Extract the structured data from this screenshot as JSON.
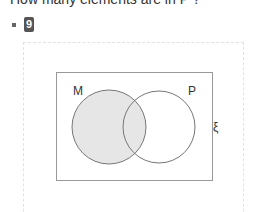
{
  "question": {
    "text": "How many elements are in P ?"
  },
  "answer": {
    "bullet": "square-bullet",
    "value": "9"
  },
  "diagram": {
    "type": "venn",
    "universe_label": "ξ",
    "sets": [
      {
        "label": "M",
        "shaded": true
      },
      {
        "label": "P",
        "shaded": false
      }
    ],
    "colors": {
      "shade": "#e6e6e6",
      "stroke": "#777777",
      "frame": "#999999"
    }
  }
}
